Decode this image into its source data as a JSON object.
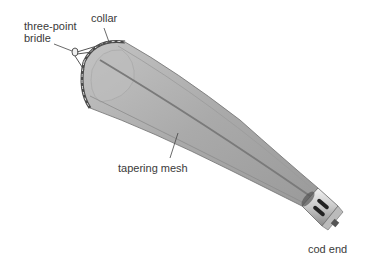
{
  "diagram": {
    "labels": {
      "bridle_line1": "three-point",
      "bridle_line2": "bridle",
      "collar": "collar",
      "mesh": "tapering mesh",
      "cod_end": "cod end"
    },
    "colors": {
      "mesh_fill": "#b3b3b3",
      "mesh_dark": "#8f8f8f",
      "seam": "#7a7a7a",
      "collar": "#5a5a5a",
      "cod_end_metal": "#d9d9d9",
      "leader_line": "#444444",
      "text": "#3a3a3a"
    }
  }
}
